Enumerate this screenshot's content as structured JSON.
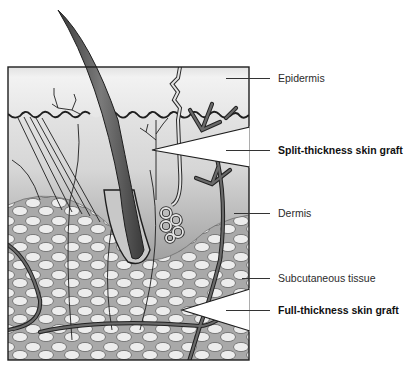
{
  "diagram": {
    "colors": {
      "epidermis": "#ececec",
      "dermis_top": "#e4e4e4",
      "dermis_bottom": "#8a8a8a",
      "fat_cell": "#ececec",
      "outline": "#222222",
      "vessel": "#5a5a5a",
      "hair": "#4a4a4a"
    },
    "labels": [
      {
        "id": "epidermis",
        "text": "Epidermis",
        "bold": false,
        "y": 72
      },
      {
        "id": "split-thickness",
        "text": "Split-thickness skin graft",
        "bold": true,
        "y": 144
      },
      {
        "id": "dermis",
        "text": "Dermis",
        "bold": false,
        "y": 207
      },
      {
        "id": "subcutaneous",
        "text": "Subcutaneous tissue",
        "bold": false,
        "y": 272
      },
      {
        "id": "full-thickness",
        "text": "Full-thickness skin graft",
        "bold": true,
        "y": 304
      }
    ],
    "wedges": [
      {
        "id": "split-thickness-wedge",
        "tip": [
          152,
          150
        ],
        "top": [
          249,
          128
        ],
        "bottom": [
          249,
          166
        ]
      },
      {
        "id": "full-thickness-wedge",
        "tip": [
          182,
          310
        ],
        "top": [
          249,
          290
        ],
        "bottom": [
          249,
          330
        ]
      }
    ]
  }
}
